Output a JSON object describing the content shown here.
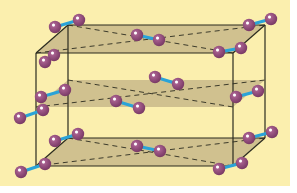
{
  "diagram": {
    "title": "",
    "colors": {
      "background": "#fbefae",
      "margin": "#ffffff",
      "layer_fill": "#c8b98a",
      "edge": "#2b2b1f",
      "bond": "#2aa3d8",
      "atom": "#7a3a66",
      "atom_highlight": "#f4e6f0"
    },
    "box": {
      "back_left_x": 68,
      "back_right_x": 265,
      "front_left_x": 36,
      "front_right_x": 233,
      "top_back_y": 25,
      "top_front_y": 53,
      "bottom_back_y": 138,
      "bottom_front_y": 166
    },
    "layers": [
      {
        "name": "top",
        "back_y": 25,
        "front_y": 53
      },
      {
        "name": "middle",
        "back_y": 80,
        "front_y": 107
      },
      {
        "name": "bottom",
        "back_y": 138,
        "front_y": 166
      }
    ],
    "molecules": [
      {
        "a": [
          54,
          55
        ],
        "b": [
          45,
          62
        ]
      },
      {
        "a": [
          55,
          27
        ],
        "b": [
          79,
          20
        ]
      },
      {
        "a": [
          137,
          35
        ],
        "b": [
          159,
          40
        ]
      },
      {
        "a": [
          249,
          25
        ],
        "b": [
          271,
          19
        ]
      },
      {
        "a": [
          219,
          52
        ],
        "b": [
          241,
          48
        ]
      },
      {
        "a": [
          41,
          97
        ],
        "b": [
          65,
          90
        ]
      },
      {
        "a": [
          155,
          77
        ],
        "b": [
          178,
          84
        ]
      },
      {
        "a": [
          236,
          97
        ],
        "b": [
          258,
          91
        ]
      },
      {
        "a": [
          116,
          101
        ],
        "b": [
          139,
          108
        ]
      },
      {
        "a": [
          20,
          118
        ],
        "b": [
          43,
          110
        ]
      },
      {
        "a": [
          55,
          141
        ],
        "b": [
          78,
          134
        ]
      },
      {
        "a": [
          137,
          146
        ],
        "b": [
          160,
          151
        ]
      },
      {
        "a": [
          249,
          138
        ],
        "b": [
          272,
          132
        ]
      },
      {
        "a": [
          219,
          169
        ],
        "b": [
          242,
          163
        ]
      },
      {
        "a": [
          21,
          172
        ],
        "b": [
          45,
          164
        ]
      }
    ]
  }
}
